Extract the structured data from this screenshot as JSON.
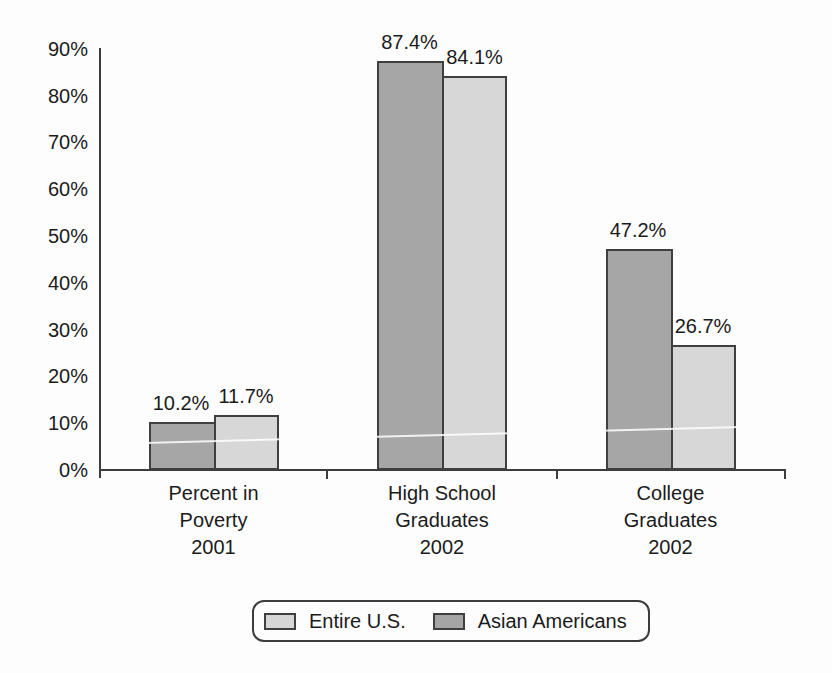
{
  "figure": {
    "background_color": "#fdfdfd",
    "axis_color": "#3c3c3c",
    "text_color": "#1b1b1b"
  },
  "chart_data": {
    "type": "bar",
    "categories": [
      [
        "Percent in",
        "Poverty",
        "2001"
      ],
      [
        "High School",
        "Graduates",
        "2002"
      ],
      [
        "College",
        "Graduates",
        "2002"
      ]
    ],
    "series": [
      {
        "name": "Asian Americans",
        "color": "#a6a6a6",
        "values": [
          10.2,
          87.4,
          47.2
        ],
        "data_labels": [
          "10.2%",
          "87.4%",
          "47.2%"
        ]
      },
      {
        "name": "Entire U.S.",
        "color": "#d7d7d7",
        "values": [
          11.7,
          84.1,
          26.7
        ],
        "data_labels": [
          "11.7%",
          "84.1%",
          "26.7%"
        ]
      }
    ],
    "bar_order": [
      "Asian Americans",
      "Entire U.S."
    ],
    "yticks": [
      "0%",
      "10%",
      "20%",
      "30%",
      "40%",
      "50%",
      "60%",
      "70%",
      "80%",
      "90%"
    ],
    "ylim": [
      0,
      90
    ],
    "grid": false,
    "legend": {
      "position": "bottom",
      "items": [
        {
          "label": "Entire U.S.",
          "color": "#d7d7d7"
        },
        {
          "label": "Asian Americans",
          "color": "#a6a6a6"
        }
      ]
    }
  }
}
